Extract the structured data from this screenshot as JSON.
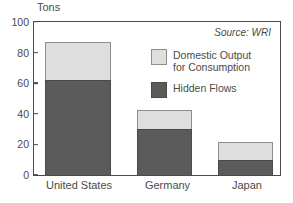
{
  "chart_data": {
    "type": "bar",
    "subtype": "stacked-vertical",
    "title": "",
    "xlabel": "",
    "ylabel": "Tons",
    "ylim": [
      0,
      100
    ],
    "yticks": [
      0,
      20,
      40,
      60,
      80,
      100
    ],
    "grid": false,
    "categories": [
      "United States",
      "Germany",
      "Japan"
    ],
    "series": [
      {
        "name": "Hidden Flows",
        "color": "#5b5b5b",
        "values": [
          61,
          30,
          10
        ]
      },
      {
        "name": "Domestic Output for Consumption",
        "color": "#dedede",
        "values": [
          25,
          12,
          11
        ]
      }
    ],
    "totals": [
      86,
      42,
      21
    ],
    "annotations": [
      "Source: WRI"
    ],
    "legend_position": "inside-upper-center"
  },
  "axis": {
    "unit_label": "Tons",
    "ytick_labels": [
      "100",
      "80",
      "60",
      "40",
      "20",
      "0"
    ],
    "category_labels": [
      "United States",
      "Germany",
      "Japan"
    ]
  },
  "legend": {
    "items": [
      {
        "label_line1": "Domestic Output",
        "label_line2": "for Consumption",
        "swatch": "light-gray-swatch"
      },
      {
        "label_line1": "Hidden Flows",
        "label_line2": "",
        "swatch": "dark-gray-swatch"
      }
    ]
  },
  "source": {
    "text": "Source: WRI"
  },
  "colors": {
    "hidden_flows": "#5b5b5b",
    "domestic_output": "#dedede",
    "frame": "#4a4a4a",
    "text": "#4a4a4a",
    "background": "#ffffff"
  }
}
